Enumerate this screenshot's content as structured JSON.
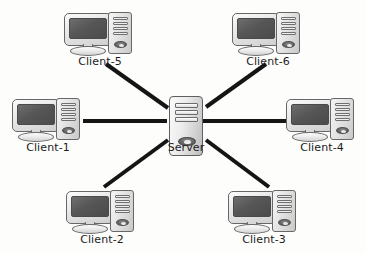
{
  "diagram": {
    "background_color": "#fdfdfc",
    "line_color": "#151515",
    "label_color": "#1b1b1b",
    "nodes": [
      {
        "id": "client5",
        "label": "Client-5",
        "icon": "desktop-computer-icon",
        "x": 64,
        "y": 12,
        "label_y": 56
      },
      {
        "id": "client6",
        "label": "Client-6",
        "icon": "desktop-computer-icon",
        "x": 232,
        "y": 12,
        "label_y": 56
      },
      {
        "id": "client1",
        "label": "Client-1",
        "icon": "desktop-computer-icon",
        "x": 12,
        "y": 98,
        "label_y": 142
      },
      {
        "id": "server",
        "label": "Server",
        "icon": "server-tower-icon",
        "x": 168,
        "y": 96,
        "label_y": 142
      },
      {
        "id": "client4",
        "label": "Client-4",
        "icon": "desktop-computer-icon",
        "x": 286,
        "y": 98,
        "label_y": 142
      },
      {
        "id": "client2",
        "label": "Client-2",
        "icon": "desktop-computer-icon",
        "x": 66,
        "y": 190,
        "label_y": 234
      },
      {
        "id": "client3",
        "label": "Client-3",
        "icon": "desktop-computer-icon",
        "x": 228,
        "y": 190,
        "label_y": 234
      }
    ],
    "links": [
      {
        "id": "link-client5-server",
        "from": "client5",
        "to": "server",
        "style": "solid",
        "x1": 106,
        "y1": 64,
        "x2": 168,
        "y2": 108
      },
      {
        "id": "link-client6-server",
        "from": "client6",
        "to": "server",
        "style": "solid",
        "x1": 266,
        "y1": 64,
        "x2": 206,
        "y2": 107
      },
      {
        "id": "link-client1-server",
        "from": "client1",
        "to": "server",
        "style": "solid",
        "x1": 83,
        "y1": 121,
        "x2": 166,
        "y2": 121
      },
      {
        "id": "link-client4-server",
        "from": "client4",
        "to": "server",
        "style": "solid",
        "x1": 204,
        "y1": 121,
        "x2": 288,
        "y2": 121
      },
      {
        "id": "link-client2-server",
        "from": "client2",
        "to": "server",
        "style": "solid",
        "x1": 104,
        "y1": 186,
        "x2": 167,
        "y2": 141
      },
      {
        "id": "link-client3-server",
        "from": "client3",
        "to": "server",
        "style": "solid",
        "x1": 206,
        "y1": 141,
        "x2": 268,
        "y2": 186
      }
    ]
  }
}
